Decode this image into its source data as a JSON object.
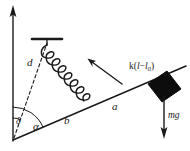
{
  "figure": {
    "labels": {
      "angle_alpha": "α",
      "angle_delta": "δ",
      "dashed_length": "d",
      "segment_b": "b",
      "segment_a": "a",
      "spring_force_prefix": "k(",
      "spring_force_l": "l",
      "spring_force_minus": "−",
      "spring_force_l0": "l",
      "spring_force_sub": "0",
      "spring_force_suffix": ")",
      "weight": "mg"
    },
    "icons": {
      "vertical_axis": "up-arrow-icon",
      "spring": "coil-spring-icon",
      "support": "ceiling-support-icon",
      "block": "block-mass-icon",
      "weight_arrow": "down-arrow-icon",
      "force_arrow": "force-arrow-icon",
      "pivot": "pivot-point-icon"
    },
    "colors": {
      "ink": "#1a1a1a",
      "block_fill": "#0d0d0d",
      "background": "#ffffff"
    },
    "geometry": {
      "pivot_x": 13,
      "pivot_y": 140,
      "beam_end_x": 186,
      "beam_end_y": 66,
      "support_x": 47,
      "support_y": 39,
      "coil_count": 7
    }
  }
}
